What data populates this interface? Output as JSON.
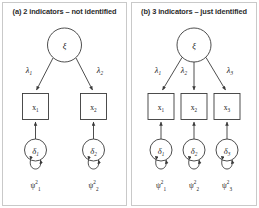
{
  "figure": {
    "type": "sem-path-diagram-pair",
    "background": "#ffffff",
    "line_color": "#3a3a3a",
    "border_color": "#c9c9c9"
  },
  "panels": [
    {
      "id": "a",
      "caption": "(a) 2 indicators – not identified",
      "latent": {
        "symbol": "ξ",
        "shape": "circle"
      },
      "loadings": [
        {
          "symbol": "λ",
          "subscript": "1"
        },
        {
          "symbol": "λ",
          "subscript": "2"
        }
      ],
      "indicators": [
        {
          "symbol": "x",
          "subscript": "1",
          "shape": "rect"
        },
        {
          "symbol": "x",
          "subscript": "2",
          "shape": "rect"
        }
      ],
      "errors": [
        {
          "symbol": "δ",
          "subscript": "1",
          "shape": "circle"
        },
        {
          "symbol": "δ",
          "subscript": "2",
          "shape": "circle"
        }
      ],
      "variances": [
        {
          "symbol": "ψ",
          "superscript": "2",
          "subscript": "1"
        },
        {
          "symbol": "ψ",
          "superscript": "2",
          "subscript": "2"
        }
      ]
    },
    {
      "id": "b",
      "caption": "(b) 3 indicators – just identified",
      "latent": {
        "symbol": "ξ",
        "shape": "circle"
      },
      "loadings": [
        {
          "symbol": "λ",
          "subscript": "1"
        },
        {
          "symbol": "λ",
          "subscript": "2"
        },
        {
          "symbol": "λ",
          "subscript": "3"
        }
      ],
      "indicators": [
        {
          "symbol": "x",
          "subscript": "1",
          "shape": "rect"
        },
        {
          "symbol": "x",
          "subscript": "2",
          "shape": "rect"
        },
        {
          "symbol": "x",
          "subscript": "3",
          "shape": "rect"
        }
      ],
      "errors": [
        {
          "symbol": "δ",
          "subscript": "1",
          "shape": "circle"
        },
        {
          "symbol": "δ",
          "subscript": "2",
          "shape": "circle"
        },
        {
          "symbol": "δ",
          "subscript": "3",
          "shape": "circle"
        }
      ],
      "variances": [
        {
          "symbol": "ψ",
          "superscript": "2",
          "subscript": "1"
        },
        {
          "symbol": "ψ",
          "superscript": "2",
          "subscript": "2"
        },
        {
          "symbol": "ψ",
          "superscript": "2",
          "subscript": "3"
        }
      ]
    }
  ]
}
